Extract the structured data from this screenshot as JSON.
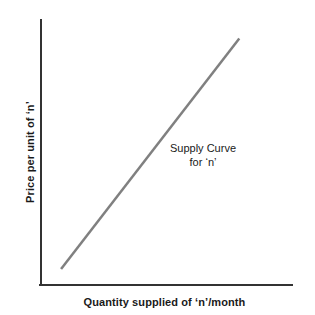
{
  "chart_data": {
    "type": "line",
    "title": "",
    "xlabel": "Quantity supplied of ‘n’/month",
    "ylabel": "Price per unit of ‘n’",
    "grid": false,
    "legend": "none",
    "axis_ticks": "none",
    "xlim": [
      0,
      100
    ],
    "ylim": [
      0,
      100
    ],
    "annotations": [
      {
        "name": "supply-curve-label",
        "line1": "Supply Curve",
        "line2": "for ‘n’",
        "x": 66,
        "y": 53
      }
    ],
    "series": [
      {
        "name": "Supply Curve for ‘n’",
        "color": "#808080",
        "width": 2.5,
        "x": [
          8,
          79
        ],
        "y": [
          6,
          93
        ]
      }
    ],
    "axes": {
      "color": "#333333",
      "width": 2,
      "origin": [
        41,
        285
      ],
      "y_top": 20,
      "x_right": 292
    },
    "background": "#ffffff"
  }
}
